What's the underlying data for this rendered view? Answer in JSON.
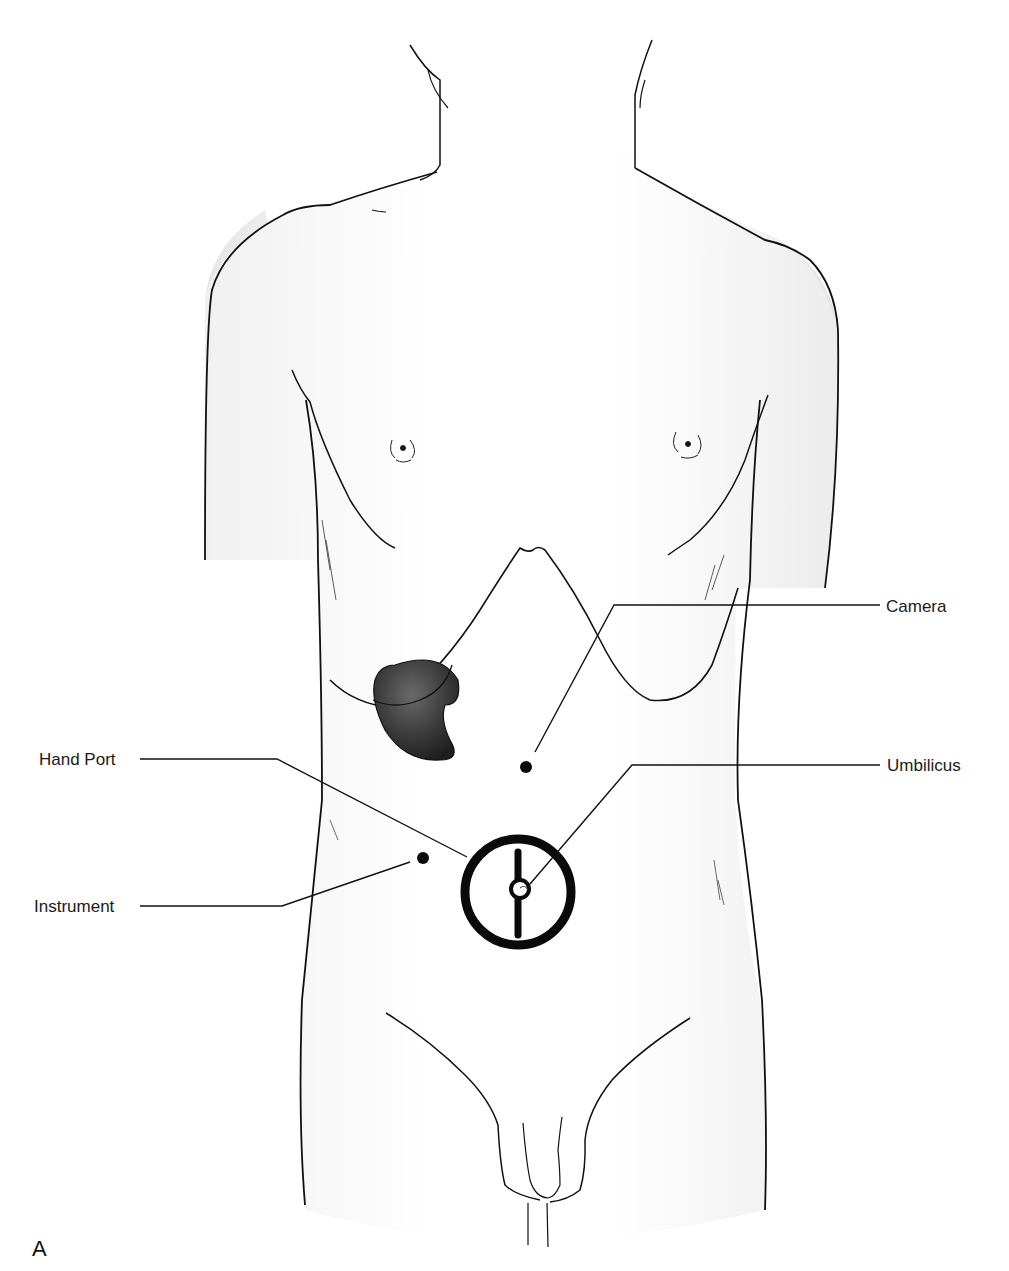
{
  "figure": {
    "panel_letter": "A",
    "colors": {
      "outline": "#111111",
      "skin_shade": "#ebebeb",
      "kidney": "#3a3a3a",
      "port": "#0a0a0a"
    },
    "labels": {
      "camera": "Camera",
      "hand_port": "Hand Port",
      "umbilicus": "Umbilicus",
      "instrument": "Instrument"
    }
  }
}
